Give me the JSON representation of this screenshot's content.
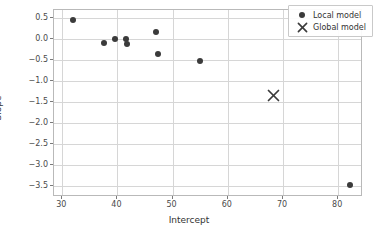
{
  "chart_data": {
    "type": "scatter",
    "title": "",
    "xlabel": "Intercept",
    "ylabel": "Slope",
    "xlim": [
      28.5,
      84.5
    ],
    "ylim": [
      -3.75,
      0.68
    ],
    "grid": true,
    "legend_position": "upper right",
    "xticks": [
      30,
      40,
      50,
      60,
      70,
      80
    ],
    "xticklabels": [
      "30",
      "40",
      "50",
      "60",
      "70",
      "80"
    ],
    "yticks": [
      0.5,
      0.0,
      -0.5,
      -1.0,
      -1.5,
      -2.0,
      -2.5,
      -3.0,
      -3.5
    ],
    "yticklabels": [
      "0.5",
      "0.0",
      "−0.5",
      "−1.0",
      "−1.5",
      "−2.0",
      "−2.5",
      "−3.0",
      "−3.5"
    ],
    "marker_color": "#3b3b3b",
    "grid_color": "#d6d6d6",
    "series": [
      {
        "name": "Local model",
        "marker": "circle",
        "points": [
          {
            "x": 31.9,
            "y": 0.45
          },
          {
            "x": 37.6,
            "y": -0.11
          },
          {
            "x": 39.5,
            "y": 0.0
          },
          {
            "x": 41.6,
            "y": -0.01
          },
          {
            "x": 41.8,
            "y": -0.13
          },
          {
            "x": 46.9,
            "y": 0.17
          },
          {
            "x": 47.3,
            "y": -0.36
          },
          {
            "x": 55.0,
            "y": -0.53
          },
          {
            "x": 82.1,
            "y": -3.47
          }
        ]
      },
      {
        "name": "Global model",
        "marker": "x",
        "points": [
          {
            "x": 68.3,
            "y": -1.35
          }
        ]
      }
    ]
  },
  "legend": {
    "entries": [
      {
        "label": "Local model",
        "marker": "circle-marker"
      },
      {
        "label": "Global model",
        "marker": "x-marker"
      }
    ]
  }
}
